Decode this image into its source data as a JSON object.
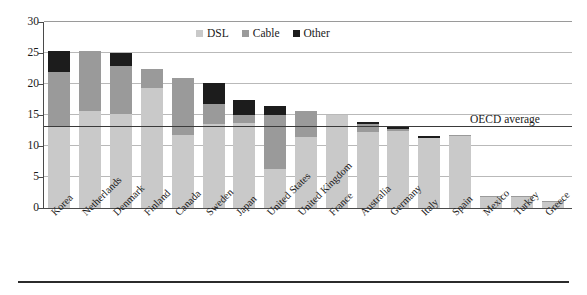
{
  "chart_data": {
    "type": "bar",
    "title": "",
    "subtitle": "",
    "xlabel": "",
    "ylabel": "",
    "ylim": [
      0,
      30
    ],
    "ytick_step": 5,
    "yticks": [
      0,
      5,
      10,
      15,
      20,
      25,
      30
    ],
    "grid": true,
    "stacked": true,
    "legend_position": "top-center",
    "categories": [
      "Korea",
      "Netherlands",
      "Denmark",
      "Finland",
      "Canada",
      "Sweden",
      "Japan",
      "United States",
      "United Kingdom",
      "France",
      "Australia",
      "Germany",
      "Italy",
      "Spain",
      "Mexico",
      "Turkey",
      "Greece"
    ],
    "series": [
      {
        "name": "DSL",
        "color": "#c9c9c9",
        "values": [
          13.3,
          15.6,
          15.2,
          19.4,
          11.7,
          13.6,
          13.7,
          6.3,
          11.5,
          15.0,
          12.3,
          12.5,
          11.3,
          11.6,
          1.7,
          1.7,
          1.0
        ]
      },
      {
        "name": "Cable",
        "color": "#9a9a9a",
        "values": [
          8.7,
          9.7,
          7.7,
          3.0,
          9.2,
          3.1,
          1.3,
          8.7,
          4.2,
          0.0,
          1.2,
          0.2,
          0.0,
          0.2,
          0.3,
          0.2,
          0.2
        ]
      },
      {
        "name": "Other",
        "color": "#1c1c1c",
        "values": [
          3.3,
          0.0,
          2.1,
          0.0,
          0.0,
          3.4,
          2.5,
          1.5,
          0.0,
          0.0,
          0.3,
          0.3,
          0.3,
          0.0,
          0.0,
          0.0,
          0.0
        ]
      }
    ],
    "totals": [
      25.3,
      25.3,
      25.0,
      22.4,
      20.9,
      20.1,
      17.5,
      16.5,
      15.7,
      15.0,
      13.8,
      13.0,
      11.6,
      11.8,
      2.0,
      1.9,
      1.2
    ],
    "reference_line": {
      "label": "OECD average",
      "value": 13.0,
      "color": "#3a3a3a"
    }
  },
  "legend": {
    "items": [
      {
        "label": "DSL",
        "color": "#c9c9c9",
        "swatch_icon": "square-swatch-icon"
      },
      {
        "label": "Cable",
        "color": "#9a9a9a",
        "swatch_icon": "square-swatch-icon"
      },
      {
        "label": "Other",
        "color": "#1c1c1c",
        "swatch_icon": "square-swatch-icon"
      }
    ]
  }
}
